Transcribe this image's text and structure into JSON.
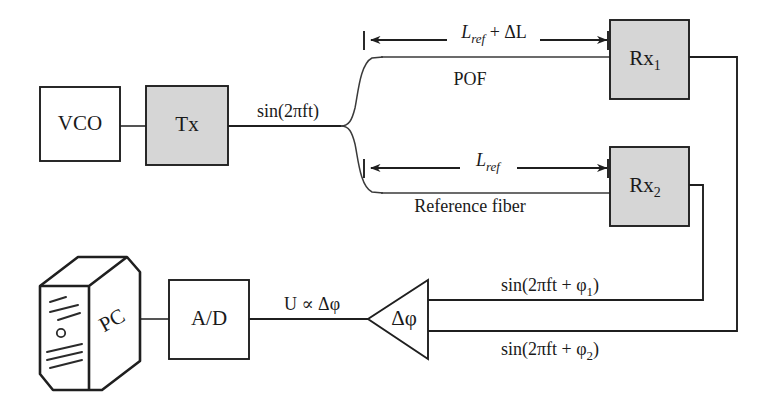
{
  "figure": {
    "kind": "block-diagram",
    "colors": {
      "ink": "#1f1f1f",
      "box_fill_shaded": "#d6d6d6",
      "box_fill_plain": "#ffffff",
      "background": "#ffffff",
      "pc_fill": "#e6e6e4"
    }
  },
  "blocks": [
    {
      "id": "vco",
      "label": "VCO",
      "sub": "",
      "shaded": false,
      "x": 40,
      "y": 87,
      "w": 80,
      "h": 74
    },
    {
      "id": "tx",
      "label": "Tx",
      "sub": "",
      "shaded": true,
      "x": 146,
      "y": 86,
      "w": 82,
      "h": 79
    },
    {
      "id": "rx1",
      "label": "Rx",
      "sub": "1",
      "shaded": true,
      "x": 610,
      "y": 20,
      "w": 79,
      "h": 79
    },
    {
      "id": "rx2",
      "label": "Rx",
      "sub": "2",
      "shaded": true,
      "x": 610,
      "y": 147,
      "w": 79,
      "h": 79
    },
    {
      "id": "ad",
      "label": "A/D",
      "sub": "",
      "shaded": false,
      "x": 169,
      "y": 280,
      "w": 80,
      "h": 79
    }
  ],
  "pc": {
    "label": "PC",
    "x": 40,
    "y": 256,
    "w": 102,
    "h": 134
  },
  "phase_detector": {
    "label": "Δφ",
    "apex_x": 368,
    "top_y": 280,
    "bottom_y": 359,
    "right_x": 428
  },
  "signal_labels": {
    "source": "sin(2πft)",
    "output_voltage": "U ∝ Δφ",
    "phase_1_prefix": "sin(2πft + φ",
    "phase_1_sub": "1",
    "phase_1_suffix": ")",
    "phase_2_prefix": "sin(2πft + φ",
    "phase_2_sub": "2",
    "phase_2_suffix": ")"
  },
  "dimensions": [
    {
      "id": "pof-length",
      "base": "L",
      "base_sub": "ref",
      "tail": " + ΔL",
      "y": 40,
      "x1": 365,
      "x2": 608
    },
    {
      "id": "reference-length",
      "base": "L",
      "base_sub": "ref",
      "tail": "",
      "y": 168,
      "x1": 365,
      "x2": 608
    }
  ],
  "fiber_labels": [
    {
      "id": "pof",
      "text": "POF",
      "x": 470,
      "y": 85
    },
    {
      "id": "reference-fiber",
      "text": "Reference fiber",
      "x": 470,
      "y": 212
    }
  ]
}
